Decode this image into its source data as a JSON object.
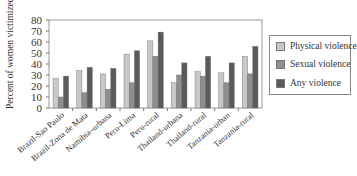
{
  "chart_data": {
    "type": "bar",
    "title": "",
    "xlabel": "",
    "ylabel": "Percent of women victimized",
    "ylim": [
      0,
      80
    ],
    "yticks": [
      0,
      10,
      20,
      30,
      40,
      50,
      60,
      70,
      80
    ],
    "grid": false,
    "legend_position": "right",
    "categories": [
      "Brazil-Sao Paulo",
      "Brazil-Zona de Mata",
      "Namibia–urbana",
      "Peru-Lima",
      "Peru-rural",
      "Thailand-urbana",
      "Thailand-rural",
      "Tanzania-urban",
      "Tanzania-rural"
    ],
    "series": [
      {
        "name": "Physical violence",
        "color": "#c8c8c8",
        "values": [
          27,
          34,
          31,
          49,
          61,
          23,
          33,
          32,
          47
        ]
      },
      {
        "name": "Sexual violence",
        "color": "#8e8e8e",
        "values": [
          10,
          14,
          17,
          23,
          47,
          30,
          29,
          23,
          31
        ]
      },
      {
        "name": "Any violence",
        "color": "#5a5a5a",
        "values": [
          29,
          37,
          36,
          52,
          69,
          41,
          47,
          41,
          56
        ]
      }
    ]
  }
}
